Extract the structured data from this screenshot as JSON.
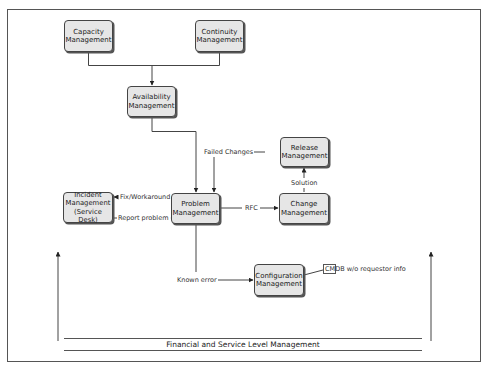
{
  "diagram": {
    "nodes": {
      "capacity": {
        "label": "Capacity Management"
      },
      "continuity": {
        "label": "Continuity Management"
      },
      "availability": {
        "label": "Availability Management"
      },
      "incident": {
        "label": "Incident Management (Service Desk)"
      },
      "problem": {
        "label": "Problem Management"
      },
      "release": {
        "label": "Release Management"
      },
      "change": {
        "label": "Change Management"
      },
      "configuration": {
        "label": "Configuration Management"
      }
    },
    "edge_labels": {
      "failed_changes": "Failed Changes",
      "fix_workaround": "Fix/Workaround",
      "report_problem": "Report problem",
      "rfc": "RFC",
      "solution": "Solution",
      "known_error": "Known error"
    },
    "annotation": {
      "cmdb_note": "CMDB w/o requestor info"
    },
    "banner": {
      "label": "Financial and Service Level Management"
    },
    "colors": {
      "box_fill": "#e6e6e6",
      "box_border": "#444444",
      "line": "#444444"
    }
  }
}
